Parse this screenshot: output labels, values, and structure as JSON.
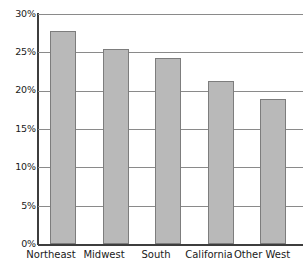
{
  "chart_data": {
    "type": "bar",
    "title": "",
    "subtitle": "",
    "xlabel": "",
    "ylabel": "",
    "categories": [
      "Northeast",
      "Midwest",
      "South",
      "California",
      "Other West"
    ],
    "values": [
      27.8,
      25.5,
      24.3,
      21.3,
      18.9
    ],
    "value_labels": [
      "27.8%",
      "25.5%",
      "24.3%",
      "21.3%",
      "18.9%"
    ],
    "series": [
      {
        "name": "",
        "values": [
          27.8,
          25.5,
          24.3,
          21.3,
          18.9
        ]
      }
    ],
    "ylim": [
      0,
      30
    ],
    "ytick_values": [
      0,
      5,
      10,
      15,
      20,
      25,
      30
    ],
    "ytick_labels": [
      "0%",
      "5%",
      "10%",
      "15%",
      "20%",
      "25%",
      "30%"
    ],
    "grid": true,
    "grid_axis": "y",
    "legend": false,
    "legend_position": "none",
    "annotations": [],
    "colors": {
      "bar_fill": "#b9b9b9",
      "bar_border": "#7d7d7d",
      "gridline": "#8a8a8a",
      "axis": "#3d3d3d",
      "text": "#1a1a1a",
      "background": "#ffffff"
    }
  }
}
